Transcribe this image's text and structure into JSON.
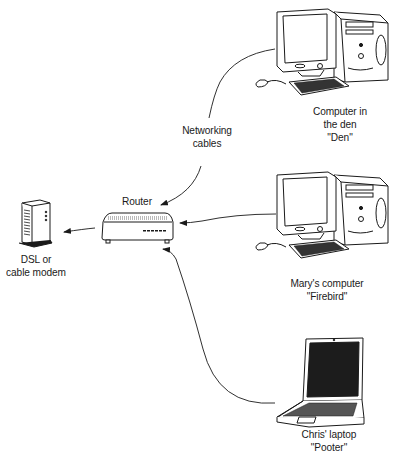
{
  "diagram": {
    "type": "home network",
    "nodes": {
      "modem": {
        "label_line1": "DSL or",
        "label_line2": "cable modem"
      },
      "router": {
        "label": "Router"
      },
      "den_computer": {
        "label_line1": "Computer in",
        "label_line2": "the den",
        "label_line3": "\"Den\""
      },
      "marys_computer": {
        "label_line1": "Mary's computer",
        "label_line2": "\"Firebird\""
      },
      "chris_laptop": {
        "label_line1": "Chris' laptop",
        "label_line2": "\"Pooter\""
      }
    },
    "annotation": {
      "line1": "Networking",
      "line2": "cables"
    },
    "edges": [
      {
        "from": "router",
        "to": "modem"
      },
      {
        "from": "den_computer",
        "to": "router"
      },
      {
        "from": "marys_computer",
        "to": "router"
      },
      {
        "from": "chris_laptop",
        "to": "router"
      }
    ]
  }
}
